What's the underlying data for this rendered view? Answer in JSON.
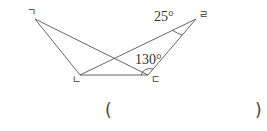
{
  "diagram": {
    "vertices": {
      "giyeok": {
        "label": "ㄱ",
        "x": 35,
        "y": 19
      },
      "nieun": {
        "label": "ㄴ",
        "x": 80,
        "y": 75
      },
      "digeut": {
        "label": "ㄷ",
        "x": 148,
        "y": 75
      },
      "rieul": {
        "label": "ㄹ",
        "x": 196,
        "y": 19
      }
    },
    "segments": [
      [
        "ㄱ",
        "ㄴ"
      ],
      [
        "ㄱ",
        "ㄷ"
      ],
      [
        "ㄴ",
        "ㄷ"
      ],
      [
        "ㄴ",
        "ㄹ"
      ],
      [
        "ㄷ",
        "ㄹ"
      ]
    ],
    "angles": {
      "at_rieul": "25°",
      "at_digeut": "130°"
    },
    "line_color": "#555555"
  },
  "answer": {
    "open_paren": "(",
    "close_paren": ")"
  }
}
